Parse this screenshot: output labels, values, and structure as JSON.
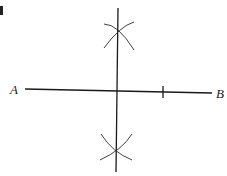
{
  "diagram": {
    "labels": {
      "point_a": "A",
      "point_b": "B"
    },
    "segment": {
      "from": "A",
      "to": "B"
    },
    "colors": {
      "ink": "#1a1a1a",
      "background": "#ffffff"
    }
  }
}
